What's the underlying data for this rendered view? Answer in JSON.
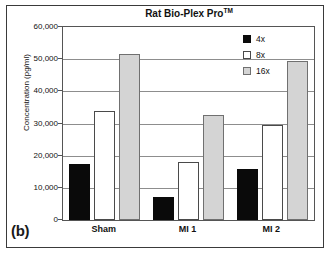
{
  "panel": {
    "label": "(b)"
  },
  "chart_data": {
    "type": "bar",
    "title": "Rat Bio-Plex Pro",
    "title_superscript": "TM",
    "xlabel": "",
    "ylabel": "Concentration (pg/ml)",
    "categories": [
      "Sham",
      "MI 1",
      "MI 2"
    ],
    "series": [
      {
        "name": "4x",
        "color": "#0a0a0a",
        "values": [
          17500,
          7000,
          15800
        ]
      },
      {
        "name": "8x",
        "color": "#ffffff",
        "values": [
          33800,
          18000,
          29500
        ]
      },
      {
        "name": "16x",
        "color": "#d4d4d4",
        "values": [
          51500,
          32500,
          49300
        ]
      }
    ],
    "ylim": [
      0,
      60000
    ],
    "ytick_values": [
      0,
      10000,
      20000,
      30000,
      40000,
      50000,
      60000
    ],
    "ytick_labels": [
      "0",
      "10,000",
      "20,000",
      "30,000",
      "40,000",
      "50,000",
      "60,000"
    ],
    "grid": true,
    "legend_position": "top-right"
  }
}
